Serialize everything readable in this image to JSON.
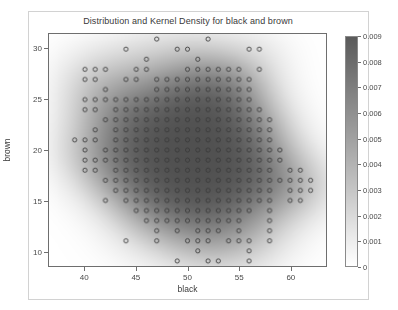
{
  "chart_data": {
    "type": "scatter",
    "title": "Distribution and Kernel Density for black and brown",
    "xlabel": "black",
    "ylabel": "brown",
    "xlim": [
      36.5,
      63.5
    ],
    "ylim": [
      8.5,
      31.5
    ],
    "xticks": [
      40,
      45,
      50,
      55,
      60
    ],
    "yticks": [
      10,
      15,
      20,
      25,
      30
    ],
    "grid": false,
    "legend": "none",
    "marker": "open-circle",
    "overlay": "kernel-density-heatmap",
    "colormap": "grayscale-dark-to-white",
    "colorbar": {
      "min": 0,
      "max": 0.009,
      "ticks": [
        0,
        0.001,
        0.002,
        0.003,
        0.004,
        0.005,
        0.006,
        0.007,
        0.008,
        0.009
      ],
      "tick_labels": [
        "0",
        "0.001",
        "0.002",
        "0.003",
        "0.004",
        "0.005",
        "0.006",
        "0.007",
        "0.008",
        "0.009"
      ],
      "position": "right",
      "title": ""
    },
    "density_peak": {
      "x": 49,
      "y": 20,
      "value": 0.009
    },
    "points": [
      [
        47,
        31
      ],
      [
        52,
        31
      ],
      [
        44,
        30
      ],
      [
        49,
        30
      ],
      [
        50,
        30
      ],
      [
        56,
        30
      ],
      [
        57,
        30
      ],
      [
        46,
        29
      ],
      [
        51,
        29
      ],
      [
        40,
        28
      ],
      [
        41,
        28
      ],
      [
        42,
        28
      ],
      [
        45,
        28
      ],
      [
        46,
        28
      ],
      [
        50,
        28
      ],
      [
        51,
        28
      ],
      [
        52,
        28
      ],
      [
        53,
        28
      ],
      [
        54,
        28
      ],
      [
        55,
        28
      ],
      [
        57,
        28
      ],
      [
        40,
        27
      ],
      [
        41,
        27
      ],
      [
        44,
        27
      ],
      [
        45,
        27
      ],
      [
        47,
        27
      ],
      [
        48,
        27
      ],
      [
        49,
        27
      ],
      [
        50,
        27
      ],
      [
        51,
        27
      ],
      [
        52,
        27
      ],
      [
        53,
        27
      ],
      [
        54,
        27
      ],
      [
        55,
        27
      ],
      [
        56,
        27
      ],
      [
        42,
        26
      ],
      [
        47,
        26
      ],
      [
        48,
        26
      ],
      [
        49,
        26
      ],
      [
        50,
        26
      ],
      [
        51,
        26
      ],
      [
        52,
        26
      ],
      [
        53,
        26
      ],
      [
        54,
        26
      ],
      [
        55,
        26
      ],
      [
        56,
        26
      ],
      [
        40,
        25
      ],
      [
        41,
        25
      ],
      [
        42,
        25
      ],
      [
        43,
        25
      ],
      [
        44,
        25
      ],
      [
        45,
        25
      ],
      [
        46,
        25
      ],
      [
        47,
        25
      ],
      [
        48,
        25
      ],
      [
        49,
        25
      ],
      [
        50,
        25
      ],
      [
        51,
        25
      ],
      [
        52,
        25
      ],
      [
        53,
        25
      ],
      [
        54,
        25
      ],
      [
        55,
        25
      ],
      [
        56,
        25
      ],
      [
        40,
        24
      ],
      [
        41,
        24
      ],
      [
        43,
        24
      ],
      [
        44,
        24
      ],
      [
        45,
        24
      ],
      [
        46,
        24
      ],
      [
        47,
        24
      ],
      [
        48,
        24
      ],
      [
        49,
        24
      ],
      [
        50,
        24
      ],
      [
        51,
        24
      ],
      [
        52,
        24
      ],
      [
        53,
        24
      ],
      [
        54,
        24
      ],
      [
        55,
        24
      ],
      [
        56,
        24
      ],
      [
        57,
        24
      ],
      [
        42,
        23
      ],
      [
        43,
        23
      ],
      [
        44,
        23
      ],
      [
        45,
        23
      ],
      [
        46,
        23
      ],
      [
        47,
        23
      ],
      [
        48,
        23
      ],
      [
        49,
        23
      ],
      [
        50,
        23
      ],
      [
        51,
        23
      ],
      [
        52,
        23
      ],
      [
        53,
        23
      ],
      [
        54,
        23
      ],
      [
        55,
        23
      ],
      [
        56,
        23
      ],
      [
        57,
        23
      ],
      [
        58,
        23
      ],
      [
        41,
        22
      ],
      [
        43,
        22
      ],
      [
        44,
        22
      ],
      [
        45,
        22
      ],
      [
        46,
        22
      ],
      [
        47,
        22
      ],
      [
        48,
        22
      ],
      [
        49,
        22
      ],
      [
        50,
        22
      ],
      [
        51,
        22
      ],
      [
        52,
        22
      ],
      [
        53,
        22
      ],
      [
        54,
        22
      ],
      [
        55,
        22
      ],
      [
        56,
        22
      ],
      [
        57,
        22
      ],
      [
        58,
        22
      ],
      [
        39,
        21
      ],
      [
        40,
        21
      ],
      [
        41,
        21
      ],
      [
        43,
        21
      ],
      [
        44,
        21
      ],
      [
        45,
        21
      ],
      [
        46,
        21
      ],
      [
        47,
        21
      ],
      [
        48,
        21
      ],
      [
        49,
        21
      ],
      [
        50,
        21
      ],
      [
        51,
        21
      ],
      [
        52,
        21
      ],
      [
        53,
        21
      ],
      [
        54,
        21
      ],
      [
        55,
        21
      ],
      [
        56,
        21
      ],
      [
        57,
        21
      ],
      [
        58,
        21
      ],
      [
        40,
        20
      ],
      [
        42,
        20
      ],
      [
        43,
        20
      ],
      [
        44,
        20
      ],
      [
        45,
        20
      ],
      [
        46,
        20
      ],
      [
        47,
        20
      ],
      [
        48,
        20
      ],
      [
        49,
        20
      ],
      [
        50,
        20
      ],
      [
        51,
        20
      ],
      [
        52,
        20
      ],
      [
        53,
        20
      ],
      [
        54,
        20
      ],
      [
        55,
        20
      ],
      [
        56,
        20
      ],
      [
        57,
        20
      ],
      [
        58,
        20
      ],
      [
        59,
        20
      ],
      [
        40,
        19
      ],
      [
        41,
        19
      ],
      [
        42,
        19
      ],
      [
        43,
        19
      ],
      [
        44,
        19
      ],
      [
        45,
        19
      ],
      [
        46,
        19
      ],
      [
        47,
        19
      ],
      [
        48,
        19
      ],
      [
        49,
        19
      ],
      [
        50,
        19
      ],
      [
        51,
        19
      ],
      [
        52,
        19
      ],
      [
        53,
        19
      ],
      [
        54,
        19
      ],
      [
        55,
        19
      ],
      [
        56,
        19
      ],
      [
        57,
        19
      ],
      [
        58,
        19
      ],
      [
        59,
        19
      ],
      [
        40,
        18
      ],
      [
        41,
        18
      ],
      [
        43,
        18
      ],
      [
        44,
        18
      ],
      [
        45,
        18
      ],
      [
        46,
        18
      ],
      [
        47,
        18
      ],
      [
        48,
        18
      ],
      [
        49,
        18
      ],
      [
        50,
        18
      ],
      [
        51,
        18
      ],
      [
        52,
        18
      ],
      [
        53,
        18
      ],
      [
        54,
        18
      ],
      [
        55,
        18
      ],
      [
        56,
        18
      ],
      [
        57,
        18
      ],
      [
        58,
        18
      ],
      [
        60,
        18
      ],
      [
        61,
        18
      ],
      [
        42,
        17
      ],
      [
        43,
        17
      ],
      [
        44,
        17
      ],
      [
        45,
        17
      ],
      [
        46,
        17
      ],
      [
        47,
        17
      ],
      [
        48,
        17
      ],
      [
        49,
        17
      ],
      [
        50,
        17
      ],
      [
        51,
        17
      ],
      [
        52,
        17
      ],
      [
        53,
        17
      ],
      [
        54,
        17
      ],
      [
        55,
        17
      ],
      [
        56,
        17
      ],
      [
        57,
        17
      ],
      [
        58,
        17
      ],
      [
        59,
        17
      ],
      [
        60,
        17
      ],
      [
        61,
        17
      ],
      [
        62,
        17
      ],
      [
        43,
        16
      ],
      [
        44,
        16
      ],
      [
        45,
        16
      ],
      [
        46,
        16
      ],
      [
        47,
        16
      ],
      [
        48,
        16
      ],
      [
        49,
        16
      ],
      [
        50,
        16
      ],
      [
        51,
        16
      ],
      [
        52,
        16
      ],
      [
        53,
        16
      ],
      [
        54,
        16
      ],
      [
        55,
        16
      ],
      [
        56,
        16
      ],
      [
        57,
        16
      ],
      [
        58,
        16
      ],
      [
        60,
        16
      ],
      [
        61,
        16
      ],
      [
        62,
        16
      ],
      [
        42,
        15
      ],
      [
        44,
        15
      ],
      [
        45,
        15
      ],
      [
        46,
        15
      ],
      [
        47,
        15
      ],
      [
        48,
        15
      ],
      [
        49,
        15
      ],
      [
        50,
        15
      ],
      [
        51,
        15
      ],
      [
        52,
        15
      ],
      [
        53,
        15
      ],
      [
        54,
        15
      ],
      [
        55,
        15
      ],
      [
        56,
        15
      ],
      [
        57,
        15
      ],
      [
        58,
        15
      ],
      [
        60,
        15
      ],
      [
        61,
        15
      ],
      [
        45,
        14
      ],
      [
        46,
        14
      ],
      [
        47,
        14
      ],
      [
        48,
        14
      ],
      [
        49,
        14
      ],
      [
        50,
        14
      ],
      [
        51,
        14
      ],
      [
        52,
        14
      ],
      [
        53,
        14
      ],
      [
        54,
        14
      ],
      [
        55,
        14
      ],
      [
        56,
        14
      ],
      [
        58,
        14
      ],
      [
        46,
        13
      ],
      [
        47,
        13
      ],
      [
        48,
        13
      ],
      [
        49,
        13
      ],
      [
        50,
        13
      ],
      [
        51,
        13
      ],
      [
        52,
        13
      ],
      [
        53,
        13
      ],
      [
        54,
        13
      ],
      [
        55,
        13
      ],
      [
        58,
        13
      ],
      [
        47,
        12
      ],
      [
        49,
        12
      ],
      [
        51,
        12
      ],
      [
        52,
        12
      ],
      [
        53,
        12
      ],
      [
        55,
        12
      ],
      [
        58,
        12
      ],
      [
        44,
        11
      ],
      [
        47,
        11
      ],
      [
        50,
        11
      ],
      [
        51,
        11
      ],
      [
        52,
        11
      ],
      [
        54,
        11
      ],
      [
        55,
        11
      ],
      [
        56,
        11
      ],
      [
        58,
        11
      ],
      [
        51,
        10
      ],
      [
        56,
        10
      ],
      [
        49,
        9
      ],
      [
        52,
        9
      ],
      [
        53,
        9
      ],
      [
        56,
        9
      ]
    ]
  }
}
